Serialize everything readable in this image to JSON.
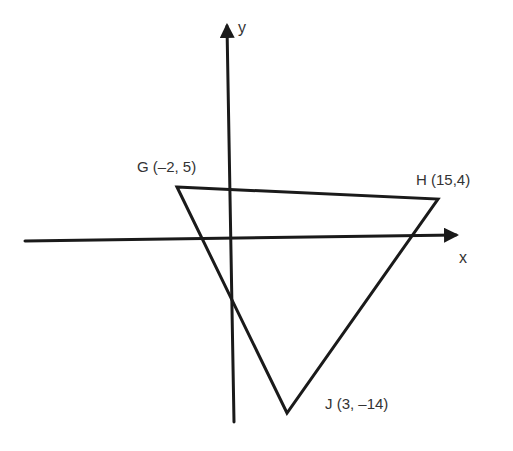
{
  "diagram": {
    "type": "coordinate-plane-triangle",
    "colors": {
      "stroke": "#1a1a1a",
      "text": "#333333",
      "background": "#ffffff"
    },
    "axes": {
      "x_label": "x",
      "y_label": "y"
    },
    "vertices": [
      {
        "name": "G",
        "label": "G (–2, 5)",
        "x": -2,
        "y": 5
      },
      {
        "name": "H",
        "label": "H (15,4)",
        "x": 15,
        "y": 4
      },
      {
        "name": "J",
        "label": "J (3, –14)",
        "x": 3,
        "y": -14
      }
    ]
  }
}
